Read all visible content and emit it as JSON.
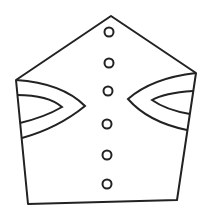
{
  "drawing": {
    "description": "Line drawing of a pentagon-shaped garment/mitre with two eye-shaped cutouts and a vertical row of buttons",
    "stroke_color": "#222222",
    "fill_color": "#ffffff",
    "background": "#ffffff",
    "stroke_width": 2,
    "outline_points": "111,16 196,73 177,200 28,204 16,80",
    "left_eye": {
      "outer": "M16,80 Q62,83 85,106 Q58,128 22,138",
      "inner": "M17,95 Q48,95 62,107 Q45,117 20,123"
    },
    "right_eye": {
      "outer": "M196,73 Q152,78 128,99 Q148,122 187,130",
      "inner": "M193,91 Q164,93 152,100 Q166,110 190,114"
    },
    "buttons": [
      {
        "cx": 109,
        "cy": 32,
        "r": 4.5
      },
      {
        "cx": 109,
        "cy": 63,
        "r": 4.5
      },
      {
        "cx": 108,
        "cy": 91,
        "r": 4.5
      },
      {
        "cx": 107,
        "cy": 124,
        "r": 4.5
      },
      {
        "cx": 107,
        "cy": 155,
        "r": 4.5
      },
      {
        "cx": 107,
        "cy": 184,
        "r": 4.5
      }
    ]
  }
}
